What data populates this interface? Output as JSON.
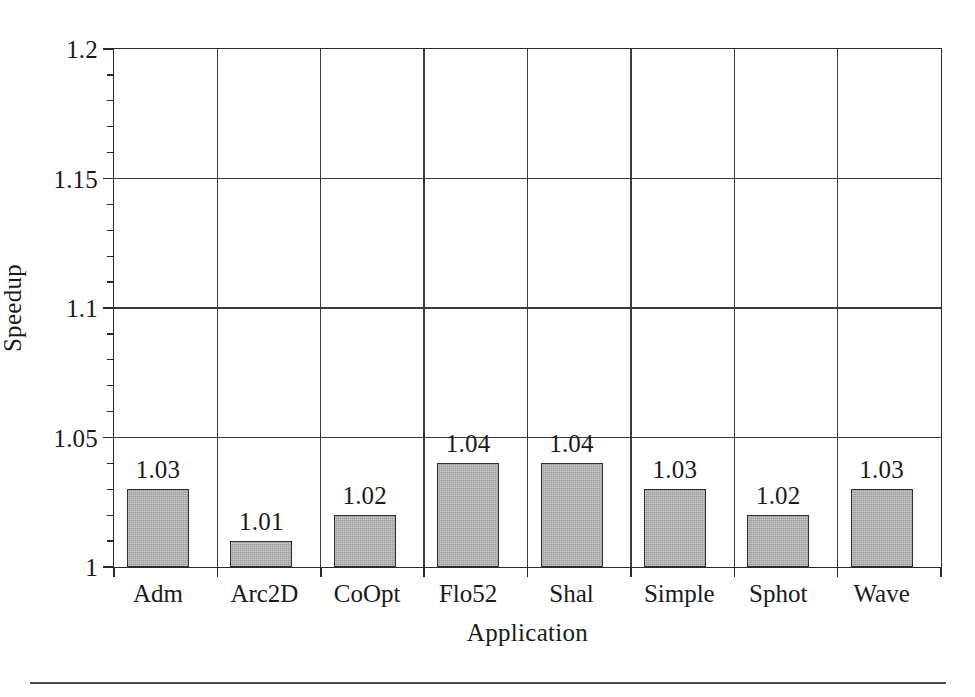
{
  "figure": {
    "background_color": "#ffffff",
    "bar_fill_color": "#b2b2b2",
    "bar_edge_color": "#2f2f2f",
    "axis_color": "#2a2a2a",
    "grid_color": "#3a3a3a",
    "text_color": "#1a1a1a"
  },
  "chart_data": {
    "type": "bar",
    "title": "",
    "subtitle": "",
    "xlabel": "Application",
    "ylabel": "Speedup",
    "categories": [
      "Adm",
      "Arc2D",
      "CoOpt",
      "Flo52",
      "Shal",
      "Simple",
      "Sphot",
      "Wave"
    ],
    "values": [
      1.03,
      1.01,
      1.02,
      1.04,
      1.04,
      1.03,
      1.02,
      1.03
    ],
    "data_labels": [
      "1.03",
      "1.01",
      "1.02",
      "1.04",
      "1.04",
      "1.03",
      "1.02",
      "1.03"
    ],
    "ylim": [
      1,
      1.2
    ],
    "ytick_values": [
      1,
      1.05,
      1.1,
      1.15,
      1.2
    ],
    "ytick_labels": [
      "1",
      "1.05",
      "1.1",
      "1.15",
      "1.2"
    ],
    "yminor_tick_step": 0.01,
    "grid": "both",
    "legend": "none",
    "annotations": []
  }
}
